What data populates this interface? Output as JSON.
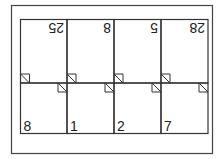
{
  "diagram": {
    "top_row_pages": [
      "25",
      "8",
      "5",
      "28"
    ],
    "bottom_row_pages": [
      "8",
      "1",
      "2",
      "7"
    ],
    "top_row_rotated": true,
    "colors": {
      "stroke": "#333333",
      "background": "#ffffff"
    }
  }
}
